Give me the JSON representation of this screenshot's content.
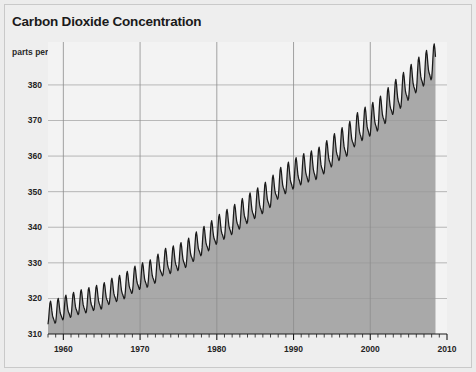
{
  "figure": {
    "title": "Carbon Dioxide Concentration",
    "subtitle": "parts per million",
    "background_color": "#ececec",
    "panel_color": "#eeeeee",
    "border_color": "#c9c9c9"
  },
  "chart_data": {
    "type": "area",
    "title": "Carbon Dioxide Concentration",
    "subtitle": "parts per million",
    "xlabel": "",
    "ylabel": "parts per million",
    "xlim": [
      1958,
      2010
    ],
    "ylim": [
      310,
      387
    ],
    "yticks": [
      310,
      320,
      330,
      340,
      350,
      360,
      370,
      380
    ],
    "ytick_labels": [
      "310",
      "320",
      "330",
      "340",
      "350",
      "360",
      "370",
      "380"
    ],
    "xticks": [
      1960,
      1970,
      1980,
      1990,
      2000,
      2010
    ],
    "xtick_labels": [
      "1960",
      "1970",
      "1980",
      "1990",
      "2000",
      "2010"
    ],
    "x_minor_tick_interval": 1,
    "grid": "horizontal-and-decade-vertical",
    "legend": "none",
    "line_color": "#1a1a1a",
    "fill_color": "#a9a9a9",
    "above_fill_color": "#f3f3f3",
    "gridline_color": "#9a9a9a",
    "series_name": "Atmospheric CO2 (Mauna Loa monthly mean)",
    "seasonal_oscillation_ppm": 6,
    "annual_mean": {
      "x": [
        1958,
        1959,
        1960,
        1961,
        1962,
        1963,
        1964,
        1965,
        1966,
        1967,
        1968,
        1969,
        1970,
        1971,
        1972,
        1973,
        1974,
        1975,
        1976,
        1977,
        1978,
        1979,
        1980,
        1981,
        1982,
        1983,
        1984,
        1985,
        1986,
        1987,
        1988,
        1989,
        1990,
        1991,
        1992,
        1993,
        1994,
        1995,
        1996,
        1997,
        1998,
        1999,
        2000,
        2001,
        2002,
        2003,
        2004,
        2005,
        2006,
        2007,
        2008
      ],
      "y": [
        315.3,
        315.9,
        316.9,
        317.6,
        318.4,
        318.9,
        319.6,
        320.0,
        321.4,
        322.2,
        323.0,
        324.6,
        325.7,
        326.3,
        327.5,
        329.7,
        330.2,
        331.1,
        332.0,
        333.8,
        335.4,
        336.8,
        338.7,
        340.1,
        341.4,
        343.0,
        344.6,
        346.0,
        347.4,
        349.2,
        351.6,
        353.1,
        354.4,
        355.6,
        356.4,
        357.1,
        358.8,
        360.8,
        362.6,
        363.8,
        366.6,
        368.3,
        369.5,
        371.0,
        373.2,
        375.8,
        377.5,
        379.8,
        381.9,
        383.8,
        385.6
      ]
    }
  }
}
